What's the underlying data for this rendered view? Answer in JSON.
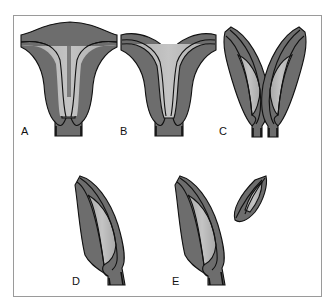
{
  "figure": {
    "colors": {
      "outer_tissue": "#6d6d6d",
      "inner_layer": "#b8b8b8",
      "outline": "#111111",
      "frame": "#9a9a9a",
      "background": "#ffffff"
    },
    "panels": [
      {
        "id": "A",
        "label": "A",
        "description": "uterus-shaped structure with wide fused top"
      },
      {
        "id": "B",
        "label": "B",
        "description": "top partially divided into two horns"
      },
      {
        "id": "C",
        "label": "C",
        "description": "two separate elongated lobes joined at base"
      },
      {
        "id": "D",
        "label": "D",
        "description": "single elongated lobe"
      },
      {
        "id": "E",
        "label": "E",
        "description": "single elongated lobe with small detached piece"
      }
    ]
  }
}
